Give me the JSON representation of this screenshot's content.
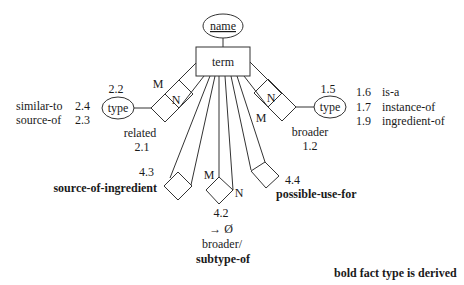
{
  "diagram": {
    "entity": {
      "label": "term"
    },
    "attribute": {
      "label": "name"
    },
    "left_type": {
      "label": "type",
      "code": "2.2",
      "values": [
        {
          "name": "similar-to",
          "code": "2.4"
        },
        {
          "name": "source-of",
          "code": "2.3"
        }
      ]
    },
    "right_type": {
      "label": "type",
      "code": "1.5",
      "values": [
        {
          "code": "1.6",
          "name": "is-a"
        },
        {
          "code": "1.7",
          "name": "instance-of"
        },
        {
          "code": "1.9",
          "name": "ingredient-of"
        }
      ]
    },
    "relationships": {
      "related": {
        "name": "related",
        "code": "2.1",
        "m": "M",
        "n": "N"
      },
      "broader": {
        "name": "broader",
        "code": "1.2",
        "m": "M",
        "n": "N"
      },
      "source_of_ingredient": {
        "name": "source-of-ingredient",
        "code": "4.3"
      },
      "subtype_of": {
        "code": "4.2",
        "arrow": "→ Ø",
        "prefix": "broader/",
        "name": "subtype-of",
        "m": "M",
        "n": "N"
      },
      "possible_use_for": {
        "name": "possible-use-for",
        "code": "4.4"
      }
    },
    "legend": "bold fact type is derived"
  }
}
